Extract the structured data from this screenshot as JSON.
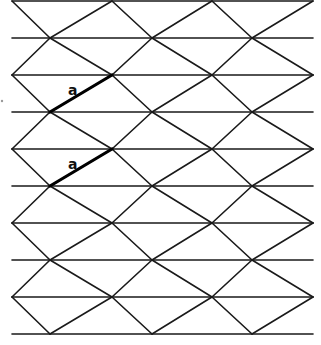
{
  "diagram": {
    "type": "triangular lattice with parallel horizontal lines",
    "stroke_color": "#1a1a1a",
    "highlight_color": "#000000",
    "horizontal_lines_y": [
      1,
      38,
      75,
      112,
      149,
      186,
      223,
      260,
      297,
      334
    ],
    "line_x_start": 12,
    "line_x_end": 313,
    "band_tops": [
      1,
      75,
      149,
      223
    ],
    "band_height": 74,
    "column_nodes_x": [
      12,
      112,
      212,
      313
    ],
    "mid_nodes_x": [
      50,
      152,
      252
    ],
    "final_partial_band": {
      "top": 297,
      "bottom": 334
    },
    "highlighted_segments": [
      {
        "label": "a",
        "from": [
          50,
          112
        ],
        "to": [
          112,
          75
        ],
        "label_pos": [
          68,
          95
        ]
      },
      {
        "label": "a",
        "from": [
          50,
          186
        ],
        "to": [
          112,
          149
        ],
        "label_pos": [
          68,
          169
        ]
      }
    ],
    "artifact_dot": [
      2,
      101
    ]
  }
}
